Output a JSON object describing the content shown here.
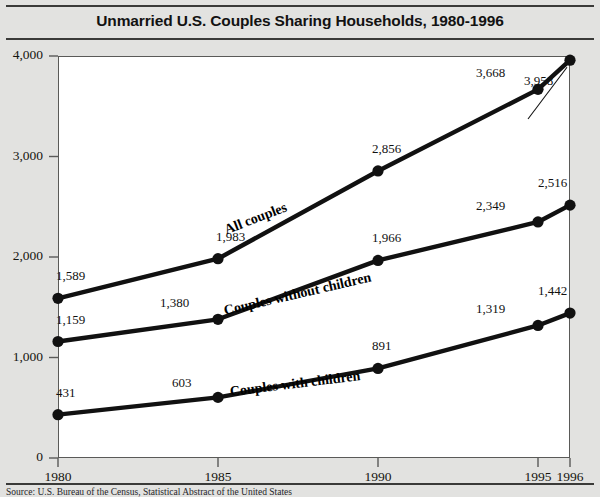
{
  "chart_data": {
    "type": "line",
    "title": "Unmarried U.S. Couples Sharing Households, 1980-1996",
    "xlabel": "",
    "ylabel": "",
    "x": [
      1980,
      1985,
      1990,
      1995,
      1996
    ],
    "xtick_labels": [
      "1980",
      "1985",
      "1990",
      "1995",
      "1996"
    ],
    "ytick_labels": [
      "0",
      "1,000",
      "2,000",
      "3,000",
      "4,000"
    ],
    "ytick_values": [
      0,
      1000,
      2000,
      3000,
      4000
    ],
    "ylim": [
      0,
      4000
    ],
    "xlim": [
      1980,
      1996
    ],
    "grid": false,
    "legend_position": "inline-on-line",
    "series": [
      {
        "name": "All couples",
        "values": [
          1589,
          2856,
          3958,
          1983,
          3668
        ],
        "points": [
          {
            "x": 1980,
            "y": 1589,
            "label": "1,589"
          },
          {
            "x": 1985,
            "y": 1983,
            "label": "1,983"
          },
          {
            "x": 1990,
            "y": 2856,
            "label": "2,856"
          },
          {
            "x": 1995,
            "y": 3668,
            "label": "3,668"
          },
          {
            "x": 1996,
            "y": 3958,
            "label": "3,958"
          }
        ]
      },
      {
        "name": "Couples without children",
        "values": [
          1159,
          1380,
          1966,
          2349,
          2516
        ],
        "points": [
          {
            "x": 1980,
            "y": 1159,
            "label": "1,159"
          },
          {
            "x": 1985,
            "y": 1380,
            "label": "1,380"
          },
          {
            "x": 1990,
            "y": 1966,
            "label": "1,966"
          },
          {
            "x": 1995,
            "y": 2349,
            "label": "2,349"
          },
          {
            "x": 1996,
            "y": 2516,
            "label": "2,516"
          }
        ]
      },
      {
        "name": "Couples with children",
        "values": [
          431,
          603,
          891,
          1319,
          1442
        ],
        "points": [
          {
            "x": 1980,
            "y": 431,
            "label": "431"
          },
          {
            "x": 1985,
            "y": 603,
            "label": "603"
          },
          {
            "x": 1990,
            "y": 891,
            "label": "891"
          },
          {
            "x": 1995,
            "y": 1319,
            "label": "1,319"
          },
          {
            "x": 1996,
            "y": 1442,
            "label": "1,442"
          }
        ]
      }
    ],
    "annotations": [
      {
        "text": "3,958",
        "note": "leader line points to the 1996 All couples marker"
      }
    ],
    "colors": {
      "line": "#111111",
      "marker": "#111111",
      "plot_background": "#ffffff",
      "page_background": "#e2e2e0",
      "axis": "#5a5a58",
      "rule": "#3a3a38"
    }
  },
  "labels": {
    "y": [
      "4,000",
      "3,000",
      "2,000",
      "1,000",
      "0"
    ],
    "x": [
      "1980",
      "1985",
      "1990",
      "1995",
      "1996"
    ],
    "all_couples": "All couples",
    "without_children": "Couples without children",
    "with_children": "Couples with children",
    "v_1589": "1,589",
    "v_1983": "1,983",
    "v_2856": "2,856",
    "v_3668": "3,668",
    "v_3958": "3,958",
    "v_1159": "1,159",
    "v_1380": "1,380",
    "v_1966": "1,966",
    "v_2349": "2,349",
    "v_2516": "2,516",
    "v_431": "431",
    "v_603": "603",
    "v_891": "891",
    "v_1319": "1,319",
    "v_1442": "1,442"
  },
  "source": {
    "text": "Source: U.S. Bureau of the Census, Statistical Abstract of the United States"
  }
}
